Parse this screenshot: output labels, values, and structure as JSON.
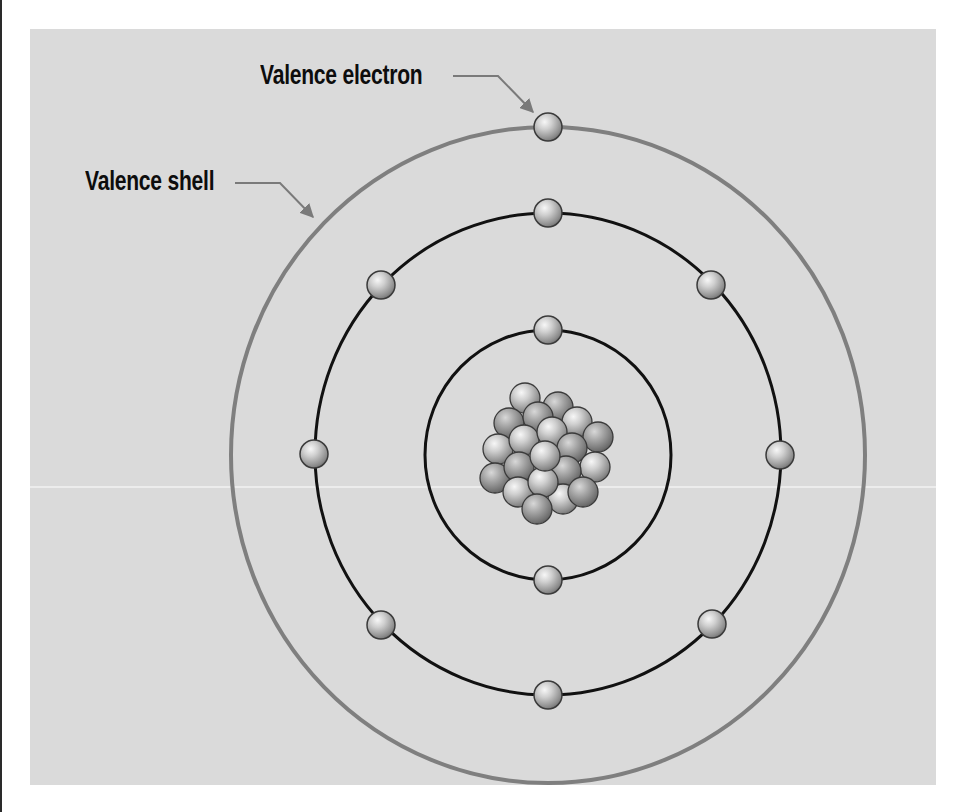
{
  "diagram": {
    "labels": {
      "valence_electron": "Valence electron",
      "valence_shell": "Valence shell"
    },
    "colors": {
      "background": "#dadada",
      "valence_shell_ring": "#7f7f7f",
      "inner_rings": "#111111",
      "electron_light": "#f2f2f2",
      "electron_dark": "#7a7a7a"
    },
    "center": [
      548,
      455
    ],
    "shells": [
      {
        "name": "inner-shell",
        "rx": 123,
        "ry": 125,
        "electrons": 2
      },
      {
        "name": "middle-shell",
        "rx": 233,
        "ry": 241,
        "electrons": 8
      },
      {
        "name": "valence-shell",
        "rx": 317,
        "ry": 328,
        "electrons": 1
      }
    ],
    "nucleus_particles": 20
  }
}
